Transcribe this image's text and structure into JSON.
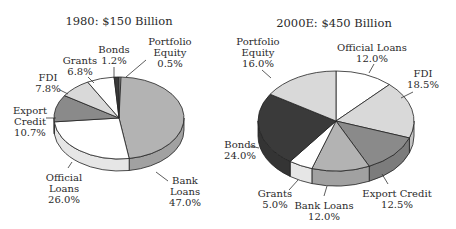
{
  "chart_data": [
    {
      "type": "pie",
      "title": "1980: $150 Billion",
      "style": "3d-pie",
      "geometry": {
        "cx": 119,
        "cy": 118,
        "rx": 65,
        "ry": 41,
        "depth": 12,
        "start_deg": -90
      },
      "title_pos": {
        "x": 119,
        "y": 14
      },
      "slices": [
        {
          "label": "Portfolio Equity",
          "value": 0.5,
          "display": "Portfolio\nEquity\n0.5%",
          "color": "#d9d9d9",
          "label_pos": {
            "x": 170,
            "y": 36
          },
          "leader": [
            [
              146,
              60
            ],
            [
              126,
              77
            ]
          ]
        },
        {
          "label": "Bank Loans",
          "value": 47.0,
          "display": "Bank\nLoans\n47.0%",
          "color": "#b3b3b3",
          "label_pos": {
            "x": 185,
            "y": 175
          },
          "leader": [
            [
              156,
              172
            ],
            [
              168,
              181
            ]
          ]
        },
        {
          "label": "Official Loans",
          "value": 26.0,
          "display": "Official\nLoans\n26.0%",
          "color": "#ffffff",
          "label_pos": {
            "x": 64,
            "y": 172
          },
          "leader": [
            [
              68,
              168
            ],
            [
              72,
              162
            ]
          ]
        },
        {
          "label": "Export Credit",
          "value": 10.7,
          "display": "Export\nCredit\n10.7%",
          "color": "#8a8a8a",
          "label_pos": {
            "x": 30,
            "y": 105
          },
          "leader": [
            [
              46,
              118
            ],
            [
              56,
              118
            ]
          ]
        },
        {
          "label": "FDI",
          "value": 7.8,
          "display": "FDI\n7.8%",
          "color": "#d9d9d9",
          "label_pos": {
            "x": 48,
            "y": 72
          },
          "leader": [
            [
              60,
              90
            ],
            [
              68,
              94
            ]
          ]
        },
        {
          "label": "Grants",
          "value": 6.8,
          "display": "Grants\n6.8%",
          "color": "#ffffff",
          "label_pos": {
            "x": 80,
            "y": 55
          },
          "leader": [
            [
              88,
              77
            ],
            [
              94,
              83
            ]
          ]
        },
        {
          "label": "Bonds",
          "value": 1.2,
          "display": "Bonds\n1.2%",
          "color": "#3a3a3a",
          "label_pos": {
            "x": 114,
            "y": 44
          },
          "leader": [
            [
              114,
              67
            ],
            [
              114,
              78
            ]
          ]
        }
      ]
    },
    {
      "type": "pie",
      "title": "2000E: $450 Billion",
      "style": "3d-pie",
      "geometry": {
        "cx": 336,
        "cy": 121,
        "rx": 78,
        "ry": 50,
        "depth": 15,
        "start_deg": -90
      },
      "title_pos": {
        "x": 334,
        "y": 16
      },
      "slices": [
        {
          "label": "Official Loans",
          "value": 12.0,
          "display": "Official Loans\n12.0%",
          "color": "#ffffff",
          "label_pos": {
            "x": 372,
            "y": 42
          },
          "leader": [
            [
              374,
              64
            ],
            [
              369,
              73
            ]
          ]
        },
        {
          "label": "FDI",
          "value": 18.5,
          "display": "FDI\n18.5%",
          "color": "#d9d9d9",
          "label_pos": {
            "x": 423,
            "y": 68
          },
          "leader": [
            [
              413,
              92
            ],
            [
              401,
              98
            ]
          ]
        },
        {
          "label": "Export Credit",
          "value": 12.5,
          "display": "Export Credit\n12.5%",
          "color": "#8a8a8a",
          "label_pos": {
            "x": 397,
            "y": 188
          },
          "leader": [
            [
              388,
              184
            ],
            [
              382,
              174
            ]
          ]
        },
        {
          "label": "Bank Loans",
          "value": 12.0,
          "display": "Bank Loans\n12.0%",
          "color": "#b3b3b3",
          "label_pos": {
            "x": 324,
            "y": 200
          },
          "leader": [
            [
              324,
              196
            ],
            [
              327,
              186
            ]
          ]
        },
        {
          "label": "Grants",
          "value": 5.0,
          "display": "Grants\n5.0%",
          "color": "#ffffff",
          "label_pos": {
            "x": 275,
            "y": 188
          },
          "leader": [
            [
              289,
              190
            ],
            [
              298,
              180
            ]
          ]
        },
        {
          "label": "Bonds",
          "value": 24.0,
          "display": "Bonds\n24.0%",
          "color": "#3a3a3a",
          "label_pos": {
            "x": 240,
            "y": 139
          },
          "leader": [
            [
              250,
              146
            ],
            [
              259,
              148
            ]
          ]
        },
        {
          "label": "Portfolio Equity",
          "value": 16.0,
          "display": "Portfolio\nEquity\n16.0%",
          "color": "#d9d9d9",
          "label_pos": {
            "x": 258,
            "y": 36
          },
          "leader": [
            [
              262,
              70
            ],
            [
              271,
              78
            ]
          ]
        }
      ]
    }
  ]
}
